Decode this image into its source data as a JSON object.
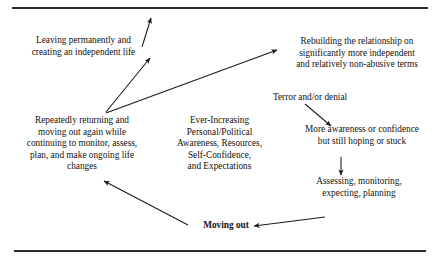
{
  "figure": {
    "type": "cycle-diagram",
    "title": "",
    "nodes": [
      {
        "id": "leaving",
        "lines": [
          "Leaving permanently and",
          "creating an independent life"
        ]
      },
      {
        "id": "rebuilding",
        "lines": [
          "Rebuilding the relationship on",
          "significantly more independent",
          "and relatively non-abusive terms"
        ]
      },
      {
        "id": "terror",
        "lines": [
          "Terror and/or denial"
        ]
      },
      {
        "id": "repeatedly",
        "lines": [
          "Repeatedly returning and",
          "moving out again while",
          "continuing to monitor, assess,",
          "plan, and make ongoing life",
          "changes"
        ]
      },
      {
        "id": "ever",
        "lines": [
          "Ever-Increasing",
          "Personal/Political",
          "Awareness, Resources,",
          "Self-Confidence,",
          "and Expectations"
        ]
      },
      {
        "id": "more",
        "lines": [
          "More awareness or confidence",
          "but still hoping or stuck"
        ]
      },
      {
        "id": "assessing",
        "lines": [
          "Assessing, monitoring,",
          "expecting, planning"
        ]
      },
      {
        "id": "moving",
        "lines": [
          "Moving out"
        ]
      }
    ],
    "arrows": [
      {
        "id": "repeatedly-to-leaving",
        "from": "repeatedly",
        "to": "leaving",
        "x1": 106,
        "y1": 112,
        "x2": 150,
        "y2": 58
      },
      {
        "id": "leaving-to-out",
        "from": "leaving",
        "to": "exit",
        "x1": 142,
        "y1": 47,
        "x2": 151,
        "y2": 18
      },
      {
        "id": "repeatedly-to-rebuilding",
        "from": "repeatedly",
        "to": "rebuilding",
        "x1": 106,
        "y1": 113,
        "x2": 277,
        "y2": 50
      },
      {
        "id": "terror-to-more",
        "from": "terror",
        "to": "more",
        "x1": 305,
        "y1": 104,
        "x2": 331,
        "y2": 126
      },
      {
        "id": "more-to-assessing",
        "from": "more",
        "to": "assessing",
        "x1": 341,
        "y1": 157,
        "x2": 341,
        "y2": 175
      },
      {
        "id": "assessing-to-moving",
        "from": "assessing",
        "to": "moving",
        "x1": 325,
        "y1": 217,
        "x2": 254,
        "y2": 226
      },
      {
        "id": "moving-to-repeatedly",
        "from": "moving",
        "to": "repeatedly",
        "x1": 188,
        "y1": 225,
        "x2": 104,
        "y2": 181
      }
    ],
    "rules": [
      {
        "id": "rule-top",
        "x": 12,
        "y": 7,
        "width": 416
      },
      {
        "id": "rule-bottom",
        "x": 14,
        "y": 250,
        "width": 412
      }
    ],
    "colors": {
      "ink": "#1a1a1a",
      "background": "#ffffff",
      "rule": "#2b2b2b"
    }
  }
}
